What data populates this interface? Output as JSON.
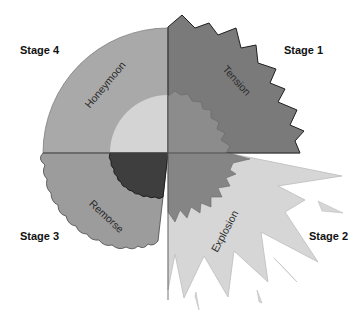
{
  "diagram": {
    "stages": [
      {
        "label": "Stage 1",
        "phase": "Tension",
        "position": "top-right",
        "color": "#7a7a7a"
      },
      {
        "label": "Stage 2",
        "phase": "Explosion",
        "position": "bottom-right",
        "color": "#d6d6d6"
      },
      {
        "label": "Stage 3",
        "phase": "Remorse",
        "position": "bottom-left",
        "color": "#9c9c9c"
      },
      {
        "label": "Stage 4",
        "phase": "Honeymoon",
        "position": "top-left",
        "color": "#a9a9a9"
      }
    ],
    "inner_colors": {
      "top_left": "#d4d4d4",
      "top_right": "#8c8c8c",
      "bottom_left": "#3e3e3e",
      "bottom_right": "#858585"
    },
    "outline_color": "#333333"
  }
}
